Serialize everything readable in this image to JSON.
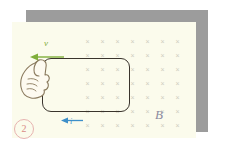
{
  "figure": {
    "label_number": "2",
    "background_color": "#ffffff",
    "page_color": "#fbfbec",
    "slab_color": "#9c9c9c"
  },
  "annotations": {
    "velocity": {
      "symbol": "v",
      "color": "#7fae3a",
      "direction": "left",
      "icon": "left-arrow-icon"
    },
    "current": {
      "symbol": "i",
      "color": "#3d8fc9",
      "direction": "left",
      "icon": "left-arrow-icon"
    },
    "magnetic_field": {
      "symbol": "B",
      "color": "#8b8aa0",
      "direction": "into-page",
      "marker": "×"
    }
  },
  "field_grid": {
    "marker": "×",
    "color": "#cfcdbe",
    "columns": 7,
    "rows": 7,
    "spacing_x": 15,
    "spacing_y": 14
  },
  "loop": {
    "name": "conducting-loop",
    "stroke_color": "#3a342c",
    "shape": "rounded-rectangle"
  },
  "hand": {
    "name": "hand-gripping-loop",
    "outline_color": "#7a6a52",
    "fill_color": "#fdfaf0"
  }
}
